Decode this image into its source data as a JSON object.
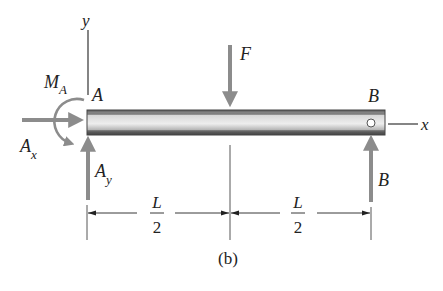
{
  "figure": {
    "caption": "(b)",
    "colors": {
      "arrow": "#8c8c8c",
      "line": "#333333",
      "beam_light": "#e2e2e2",
      "beam_dark": "#555555",
      "text": "#222222"
    },
    "axes": {
      "y_label": "y",
      "x_label": "x"
    },
    "supports": {
      "left_point": "A",
      "right_point": "B"
    },
    "forces": {
      "applied": {
        "label": "F",
        "direction": "down"
      },
      "reaction_ax": {
        "label": "A",
        "sub": "x",
        "direction": "right"
      },
      "reaction_ay": {
        "label": "A",
        "sub": "y",
        "direction": "up"
      },
      "moment_ma": {
        "label": "M",
        "sub": "A",
        "direction": "clockwise"
      },
      "reaction_b": {
        "label": "B",
        "direction": "up"
      }
    },
    "dimensions": [
      {
        "num": "L",
        "den": "2"
      },
      {
        "num": "L",
        "den": "2"
      }
    ]
  }
}
